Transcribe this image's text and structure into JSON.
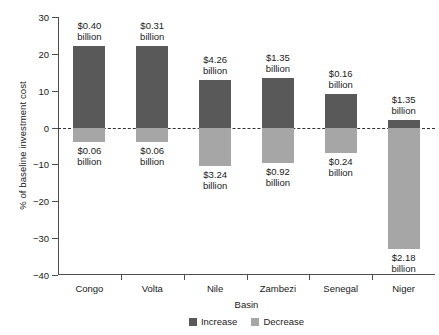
{
  "chart_data": {
    "type": "bar",
    "title": "",
    "subtitle": "",
    "xlabel": "Basin",
    "ylabel": "% of baseline investment cost",
    "categories": [
      "Congo",
      "Volta",
      "Nile",
      "Zambezi",
      "Senegal",
      "Niger"
    ],
    "ylim": [
      -40,
      30
    ],
    "yticks": [
      30,
      20,
      10,
      0,
      -10,
      -20,
      -30,
      -40
    ],
    "ytick_labels": [
      "30",
      "20",
      "10",
      "0",
      "−10",
      "−20",
      "−30",
      "−40"
    ],
    "grid": false,
    "zero_reference_line": true,
    "legend_position": "bottom-center",
    "series": [
      {
        "name": "Increase",
        "color": "#595959",
        "values": [
          22.0,
          22.0,
          13.0,
          13.5,
          9.0,
          2.0
        ],
        "value_labels": [
          "$0.40\nbillion",
          "$0.31\nbillion",
          "$4.26\nbillion",
          "$1.35\nbillion",
          "$0.16\nbillion",
          "$1.35\nbillion"
        ]
      },
      {
        "name": "Decrease",
        "color": "#a6a6a6",
        "values": [
          -4.0,
          -4.0,
          -10.5,
          -9.5,
          -7.0,
          -33.0
        ],
        "value_labels": [
          "$0.06\nbillion",
          "$0.06\nbillion",
          "$3.24\nbillion",
          "$0.92\nbillion",
          "$0.24\nbillion",
          "$2.18\nbillion"
        ]
      }
    ]
  },
  "axes": {
    "ylabel": "% of baseline investment cost",
    "xlabel": "Basin",
    "ytick_0": "30",
    "ytick_1": "20",
    "ytick_2": "10",
    "ytick_3": "0",
    "ytick_4": "−10",
    "ytick_5": "−20",
    "ytick_6": "−30",
    "ytick_7": "−40"
  },
  "legend": {
    "items": [
      {
        "label": "Increase",
        "color": "#595959"
      },
      {
        "label": "Decrease",
        "color": "#a6a6a6"
      }
    ]
  },
  "bars": [
    {
      "category": "Congo",
      "increase_label_line1": "$0.40",
      "increase_label_line2": "billion",
      "decrease_label_line1": "$0.06",
      "decrease_label_line2": "billion"
    },
    {
      "category": "Volta",
      "increase_label_line1": "$0.31",
      "increase_label_line2": "billion",
      "decrease_label_line1": "$0.06",
      "decrease_label_line2": "billion"
    },
    {
      "category": "Nile",
      "increase_label_line1": "$4.26",
      "increase_label_line2": "billion",
      "decrease_label_line1": "$3.24",
      "decrease_label_line2": "billion"
    },
    {
      "category": "Zambezi",
      "increase_label_line1": "$1.35",
      "increase_label_line2": "billion",
      "decrease_label_line1": "$0.92",
      "decrease_label_line2": "billion"
    },
    {
      "category": "Senegal",
      "increase_label_line1": "$0.16",
      "increase_label_line2": "billion",
      "decrease_label_line1": "$0.24",
      "decrease_label_line2": "billion"
    },
    {
      "category": "Niger",
      "increase_label_line1": "$1.35",
      "increase_label_line2": "billion",
      "decrease_label_line1": "$2.18",
      "decrease_label_line2": "billion"
    }
  ]
}
